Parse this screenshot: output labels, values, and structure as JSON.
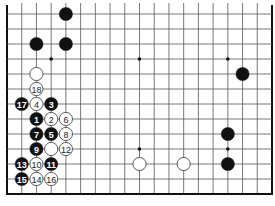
{
  "diagram": {
    "type": "go-board-fragment",
    "columns": 19,
    "visible_rows": 13,
    "edges": {
      "left": true,
      "right": true,
      "bottom": true,
      "top": false
    },
    "colors": {
      "line": "#555555",
      "edge": "#111111",
      "black": "#111111",
      "white": "#ffffff",
      "white_outline": "#333333",
      "background": "#ffffff"
    },
    "star_points": [
      {
        "col": 4,
        "row": 3
      },
      {
        "col": 10,
        "row": 3
      },
      {
        "col": 16,
        "row": 3
      },
      {
        "col": 4,
        "row": 9
      },
      {
        "col": 10,
        "row": 9
      },
      {
        "col": 16,
        "row": 9
      }
    ],
    "stones": [
      {
        "color": "black",
        "col": 5,
        "row": 0,
        "label": ""
      },
      {
        "color": "black",
        "col": 3,
        "row": 2,
        "label": ""
      },
      {
        "color": "black",
        "col": 5,
        "row": 2,
        "label": ""
      },
      {
        "color": "white",
        "col": 3,
        "row": 4,
        "label": ""
      },
      {
        "color": "white",
        "col": 3,
        "row": 5,
        "label": "18"
      },
      {
        "color": "black",
        "col": 2,
        "row": 6,
        "label": "17"
      },
      {
        "color": "white",
        "col": 3,
        "row": 6,
        "label": "4"
      },
      {
        "color": "black",
        "col": 4,
        "row": 6,
        "label": "3"
      },
      {
        "color": "black",
        "col": 3,
        "row": 7,
        "label": "1"
      },
      {
        "color": "white",
        "col": 4,
        "row": 7,
        "label": "2"
      },
      {
        "color": "white",
        "col": 5,
        "row": 7,
        "label": "6"
      },
      {
        "color": "black",
        "col": 3,
        "row": 8,
        "label": "7"
      },
      {
        "color": "black",
        "col": 4,
        "row": 8,
        "label": "5"
      },
      {
        "color": "white",
        "col": 5,
        "row": 8,
        "label": "8"
      },
      {
        "color": "black",
        "col": 3,
        "row": 9,
        "label": "9"
      },
      {
        "color": "white",
        "col": 4,
        "row": 9,
        "label": ""
      },
      {
        "color": "white",
        "col": 5,
        "row": 9,
        "label": "12"
      },
      {
        "color": "black",
        "col": 2,
        "row": 10,
        "label": "13"
      },
      {
        "color": "white",
        "col": 3,
        "row": 10,
        "label": "10"
      },
      {
        "color": "black",
        "col": 4,
        "row": 10,
        "label": "11"
      },
      {
        "color": "black",
        "col": 2,
        "row": 11,
        "label": "15"
      },
      {
        "color": "white",
        "col": 3,
        "row": 11,
        "label": "14"
      },
      {
        "color": "white",
        "col": 4,
        "row": 11,
        "label": "16"
      },
      {
        "color": "black",
        "col": 17,
        "row": 4,
        "label": ""
      },
      {
        "color": "black",
        "col": 16,
        "row": 8,
        "label": ""
      },
      {
        "color": "black",
        "col": 16,
        "row": 10,
        "label": ""
      },
      {
        "color": "white",
        "col": 10,
        "row": 10,
        "label": ""
      },
      {
        "color": "white",
        "col": 13,
        "row": 10,
        "label": ""
      }
    ]
  }
}
